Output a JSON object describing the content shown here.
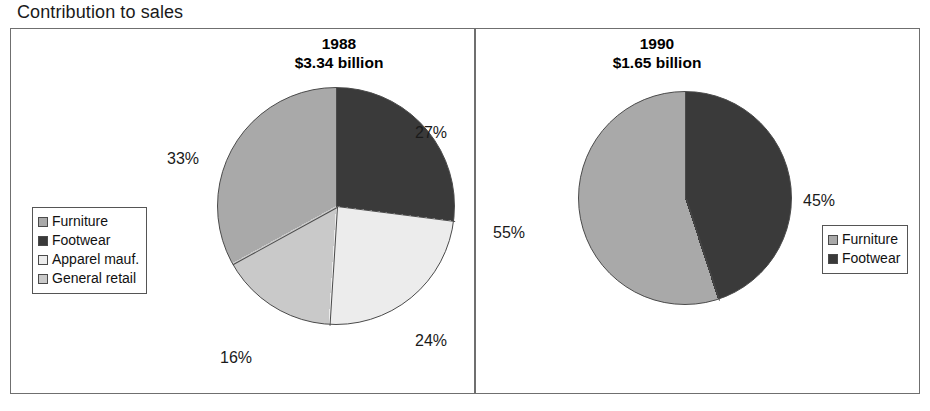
{
  "page": {
    "title": "Contribution to sales"
  },
  "colors": {
    "furniture": "#a9a9a9",
    "footwear": "#3a3a3a",
    "apparel": "#ececec",
    "general_retail": "#c9c9c9",
    "frame_border": "#6f6f6f",
    "slice_outline": "#4a4a4a",
    "background": "#ffffff",
    "text": "#1a1a1a"
  },
  "panels": [
    {
      "id": "1988",
      "year": "1988",
      "value": "$3.34 billion",
      "labels": {
        "footwear": "27%",
        "apparel": "24%",
        "general_retail": "16%",
        "furniture": "33%"
      },
      "legend": [
        {
          "label": "Furniture",
          "swatch": "#a9a9a9"
        },
        {
          "label": "Footwear",
          "swatch": "#3a3a3a"
        },
        {
          "label": "Apparel mauf.",
          "swatch": "#ececec"
        },
        {
          "label": "General retail",
          "swatch": "#c9c9c9"
        }
      ]
    },
    {
      "id": "1990",
      "year": "1990",
      "value": "$1.65 billion",
      "labels": {
        "footwear": "45%",
        "furniture": "55%"
      },
      "legend": [
        {
          "label": "Furniture",
          "swatch": "#a9a9a9"
        },
        {
          "label": "Footwear",
          "swatch": "#3a3a3a"
        }
      ]
    }
  ],
  "chart_data": [
    {
      "type": "pie",
      "title": "1988",
      "subtitle": "$3.34 billion",
      "total_value": 3.34,
      "total_units": "billion USD",
      "categories": [
        "Footwear",
        "Apparel mauf.",
        "General retail",
        "Furniture"
      ],
      "values": [
        27,
        24,
        16,
        33
      ],
      "value_labels": [
        "27%",
        "24%",
        "16%",
        "33%"
      ],
      "colors": [
        "#3a3a3a",
        "#ececec",
        "#c9c9c9",
        "#a9a9a9"
      ],
      "start_angle_deg": 0,
      "direction": "clockwise",
      "legend_position": "left",
      "legend_entries": [
        "Furniture",
        "Footwear",
        "Apparel mauf.",
        "General retail"
      ]
    },
    {
      "type": "pie",
      "title": "1990",
      "subtitle": "$1.65 billion",
      "total_value": 1.65,
      "total_units": "billion USD",
      "categories": [
        "Footwear",
        "Furniture"
      ],
      "values": [
        45,
        55
      ],
      "value_labels": [
        "45%",
        "55%"
      ],
      "colors": [
        "#3a3a3a",
        "#a9a9a9"
      ],
      "start_angle_deg": 0,
      "direction": "clockwise",
      "legend_position": "right",
      "legend_entries": [
        "Furniture",
        "Footwear"
      ]
    }
  ]
}
